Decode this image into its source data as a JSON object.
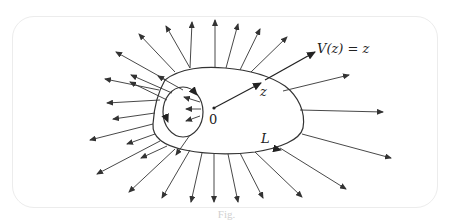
{
  "figure": {
    "labels": {
      "field": "V(z) = z",
      "point": "z",
      "origin": "0",
      "curve": "L"
    },
    "caption": "Fig."
  },
  "colors": {
    "stroke": "#333333",
    "frame": "#ececec",
    "background": "#ffffff"
  }
}
